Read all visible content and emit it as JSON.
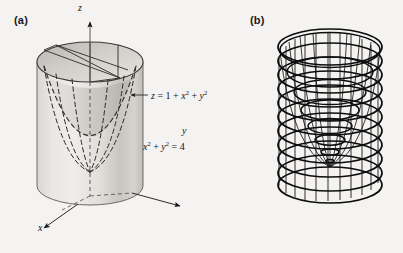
{
  "figure": {
    "background_color": "#f4f3f1",
    "ink_color": "#15161a",
    "panels": [
      {
        "id": "a",
        "label": "(a)",
        "caption_role": "shaded-solid-diagram",
        "axes": {
          "z_label": "z",
          "y_label": "y",
          "x_label": "x"
        },
        "annotations": [
          {
            "name": "paraboloid-equation",
            "text": "z = 1 + x2 + y2",
            "rendered": "z = 1 + x² + y²",
            "has_leader_arrow": true
          },
          {
            "name": "cylinder-equation",
            "text": "x2 + y2 = 4",
            "rendered": "x² + y² = 4",
            "has_leader_arrow": false
          }
        ],
        "surfaces": [
          {
            "name": "cylinder",
            "equation": "x^2 + y^2 = 4",
            "style": "shaded-gray"
          },
          {
            "name": "paraboloid",
            "equation": "z = 1 + x^2 + y^2",
            "style": "dashed-outline"
          }
        ]
      },
      {
        "id": "b",
        "label": "(b)",
        "caption_role": "wireframe-mesh-diagram",
        "surfaces": [
          {
            "name": "cylinder",
            "style": "wireframe",
            "horizontal_rings": 12,
            "vertical_meridians": 16
          },
          {
            "name": "paraboloid",
            "style": "wireframe",
            "horizontal_rings": 7,
            "vertical_meridians": 16
          }
        ]
      }
    ]
  }
}
